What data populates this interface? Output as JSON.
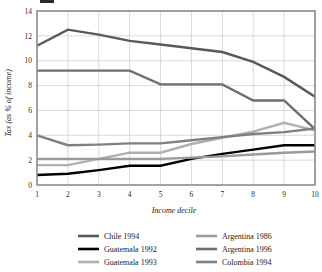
{
  "chart_data": {
    "type": "line",
    "title": "",
    "xlabel": "Income decile",
    "ylabel": "Tax (as % of income)",
    "x": [
      1,
      2,
      3,
      4,
      5,
      6,
      7,
      8,
      9,
      10
    ],
    "xtick_labels": [
      "1",
      "2",
      "3",
      "4",
      "5",
      "6",
      "7",
      "8",
      "9",
      "10"
    ],
    "ytick_labels": [
      "0",
      "2",
      "4",
      "6",
      "8",
      "10",
      "12",
      "14"
    ],
    "ytick_values": [
      0,
      2,
      4,
      6,
      8,
      10,
      12,
      14
    ],
    "ylim": [
      0,
      14
    ],
    "xlim": [
      1,
      10
    ],
    "grid": true,
    "legend_position": "bottom",
    "legend_columns": 2,
    "series": [
      {
        "name": "Chile 1994",
        "color": "#595959",
        "width": 2.4,
        "values": [
          11.2,
          12.5,
          12.1,
          11.6,
          11.3,
          11.0,
          10.7,
          9.9,
          8.7,
          7.1
        ]
      },
      {
        "name": "Guatemala 1992",
        "color": "#000000",
        "width": 2.4,
        "values": [
          0.8,
          0.9,
          1.2,
          1.55,
          1.55,
          2.1,
          2.5,
          2.85,
          3.2,
          3.2
        ]
      },
      {
        "name": "Guatemala 1993",
        "color": "#b0b0b0",
        "width": 2.4,
        "values": [
          1.6,
          1.6,
          2.1,
          2.6,
          2.6,
          3.3,
          3.8,
          4.3,
          5.0,
          4.4
        ]
      },
      {
        "name": "Argentina 1986",
        "color": "#9a9a9a",
        "width": 2.4,
        "values": [
          2.1,
          2.1,
          2.1,
          2.1,
          2.1,
          2.2,
          2.3,
          2.45,
          2.6,
          2.7
        ]
      },
      {
        "name": "Argentina 1996",
        "color": "#6e6e6e",
        "width": 2.4,
        "values": [
          9.2,
          9.2,
          9.2,
          9.2,
          8.1,
          8.1,
          8.1,
          6.8,
          6.8,
          4.5
        ]
      },
      {
        "name": "Colombia 1994",
        "color": "#808080",
        "width": 2.4,
        "values": [
          4.0,
          3.2,
          3.25,
          3.35,
          3.35,
          3.6,
          3.85,
          4.1,
          4.25,
          4.55
        ]
      }
    ]
  },
  "legend": {
    "entries": [
      {
        "label": "Chile 1994",
        "color": "#595959"
      },
      {
        "label": "Argentina 1986",
        "color": "#9a9a9a"
      },
      {
        "label": "Guatemala 1992",
        "color": "#000000"
      },
      {
        "label": "Argentina 1996",
        "color": "#6e6e6e"
      },
      {
        "label": "Guatemala 1993",
        "color": "#b0b0b0"
      },
      {
        "label": "Colombia 1994",
        "color": "#808080"
      }
    ]
  },
  "axes": {
    "y_title": "Tax (as % of income)",
    "x_title": "Income decile"
  }
}
